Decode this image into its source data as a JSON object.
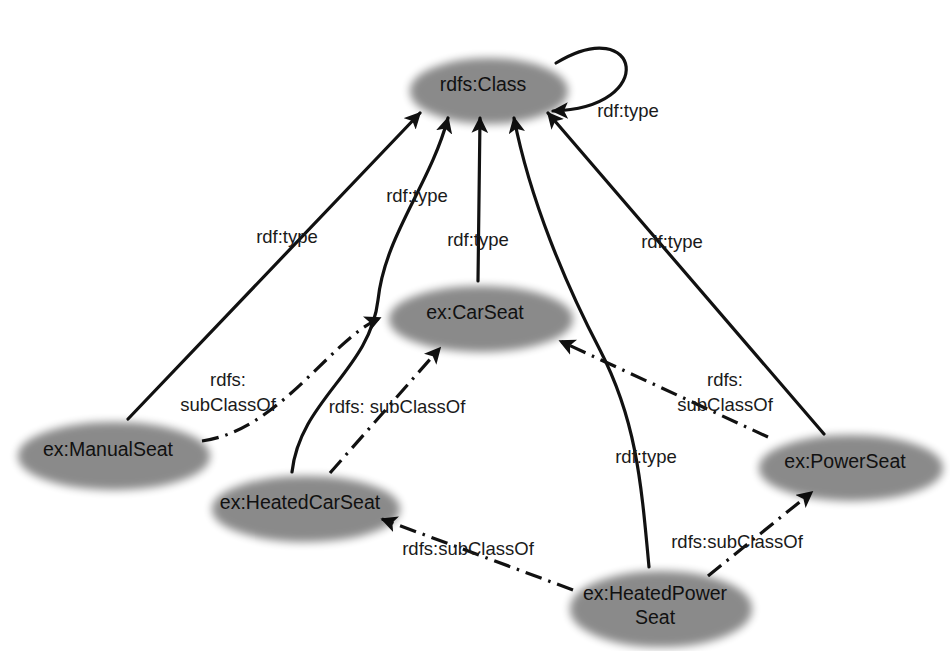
{
  "diagram": {
    "colors": {
      "node_fill": "#cbcbcb",
      "node_stroke": "#1a1a1a",
      "edge": "#111111",
      "background": "#ffffff"
    },
    "nodes": [
      {
        "id": "rdfs_class",
        "label": "rdfs:Class",
        "label_line2": "",
        "cx": 483,
        "cy": 85,
        "rx": 78,
        "ry": 32
      },
      {
        "id": "ex_carseat",
        "label": "ex:CarSeat",
        "label_line2": "",
        "cx": 475,
        "cy": 313,
        "rx": 91,
        "ry": 32
      },
      {
        "id": "ex_manualseat",
        "label": "ex:ManualSeat",
        "label_line2": "",
        "cx": 108,
        "cy": 450,
        "rx": 95,
        "ry": 33
      },
      {
        "id": "ex_heatedcarseat",
        "label": "ex:HeatedCarSeat",
        "label_line2": "",
        "cx": 300,
        "cy": 503,
        "rx": 93,
        "ry": 32
      },
      {
        "id": "ex_powerseat",
        "label": "ex:PowerSeat",
        "label_line2": "",
        "cx": 845,
        "cy": 462,
        "rx": 91,
        "ry": 32
      },
      {
        "id": "ex_heatedpowerseat",
        "label": "ex:HeatedPower",
        "label_line2": "Seat",
        "cx": 655,
        "cy": 603,
        "rx": 90,
        "ry": 37
      }
    ],
    "edges": [
      {
        "id": "e_class_self",
        "from": "rdfs_class",
        "to": "rdfs_class",
        "label": "rdf:type",
        "label_line2": "",
        "style": "solid",
        "label_x": 628,
        "label_y": 112
      },
      {
        "id": "e_manual_type",
        "from": "ex:ManualSeat",
        "to": "rdfs:Class",
        "label": "rdf:type",
        "label_line2": "",
        "style": "solid",
        "label_x": 287,
        "label_y": 238
      },
      {
        "id": "e_heatedcar_type",
        "from": "ex:HeatedCarSeat",
        "to": "rdfs:Class",
        "label": "rdf:type",
        "label_line2": "",
        "style": "solid",
        "label_x": 417,
        "label_y": 197
      },
      {
        "id": "e_carseat_type",
        "from": "ex:CarSeat",
        "to": "rdfs:Class",
        "label": "rdf:type",
        "label_line2": "",
        "style": "solid",
        "label_x": 478,
        "label_y": 241
      },
      {
        "id": "e_power_type",
        "from": "ex:PowerSeat",
        "to": "rdfs:Class",
        "label": "rdf:type",
        "label_line2": "",
        "style": "solid",
        "label_x": 672,
        "label_y": 243
      },
      {
        "id": "e_heatedpower_type",
        "from": "ex:HeatedPowerSeat",
        "to": "rdfs:Class",
        "label": "rdf:type",
        "label_line2": "",
        "style": "solid",
        "label_x": 646,
        "label_y": 458
      },
      {
        "id": "e_manual_sub",
        "from": "ex:ManualSeat",
        "to": "ex:CarSeat",
        "label": "rdfs:",
        "label_line2": "subClassOf",
        "style": "dashdot",
        "label_x": 228,
        "label_y": 388
      },
      {
        "id": "e_heatedcar_sub",
        "from": "ex:HeatedCarSeat",
        "to": "ex:CarSeat",
        "label": "rdfs: subClassOf",
        "label_line2": "",
        "style": "dashdot",
        "label_x": 397,
        "label_y": 408
      },
      {
        "id": "e_power_sub",
        "from": "ex:PowerSeat",
        "to": "ex:CarSeat",
        "label": "rdfs:",
        "label_line2": "subClassOf",
        "style": "dashdot",
        "label_x": 725,
        "label_y": 388
      },
      {
        "id": "e_hp_sub_heated",
        "from": "ex:HeatedPowerSeat",
        "to": "ex:HeatedCarSeat",
        "label": "rdfs:subClassOf",
        "label_line2": "",
        "style": "dashdot",
        "label_x": 468,
        "label_y": 550
      },
      {
        "id": "e_hp_sub_power",
        "from": "ex:HeatedPowerSeat",
        "to": "ex:PowerSeat",
        "label": "rdfs:subClassOf",
        "label_line2": "",
        "style": "dashdot",
        "label_x": 737,
        "label_y": 543
      }
    ]
  }
}
